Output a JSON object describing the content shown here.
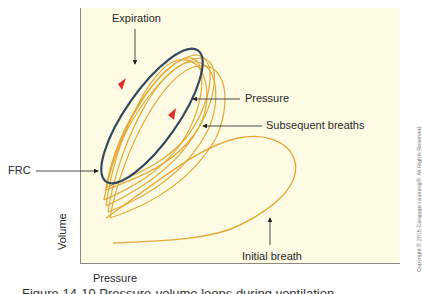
{
  "figure": {
    "labels": {
      "expiration": "Expiration",
      "pressure_arrow": "Pressure",
      "subsequent_breaths": "Subsequent breaths",
      "frc": "FRC",
      "initial_breath": "Initial breath"
    },
    "axes": {
      "x_label": "Pressure",
      "y_label": "Volume"
    },
    "copyright": "Copyright © 2015 Cengage Learning®. All Rights Reserved.",
    "caption_cropped": "Figure 14-10 Pressure-volume loops during ventilation"
  },
  "colors": {
    "plot_background": "#fdfbe3",
    "breath_loops": "#e3a93a",
    "expiration_loop": "#34495e",
    "direction_arrows": "#d9332b",
    "annotation_arrows": "#222222"
  }
}
